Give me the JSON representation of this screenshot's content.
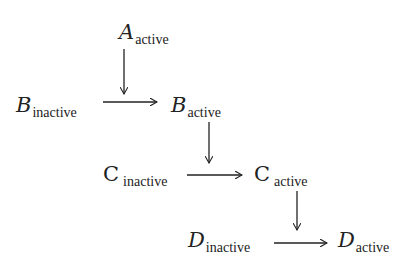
{
  "diagram": {
    "type": "state-transition",
    "nodes": [
      {
        "id": "A_active",
        "letter": "A",
        "state": "active",
        "x": 119,
        "y": 22
      },
      {
        "id": "B_inactive",
        "letter": "B",
        "state": "inactive",
        "x": 16,
        "y": 95
      },
      {
        "id": "B_active",
        "letter": "B",
        "state": "active",
        "x": 171,
        "y": 95
      },
      {
        "id": "C_inactive",
        "letter": "C",
        "state": "inactive",
        "x": 103,
        "y": 164
      },
      {
        "id": "C_active",
        "letter": "C",
        "state": "active",
        "x": 254,
        "y": 164
      },
      {
        "id": "D_inactive",
        "letter": "D",
        "state": "inactive",
        "x": 188,
        "y": 230
      },
      {
        "id": "D_active",
        "letter": "D",
        "state": "active",
        "x": 338,
        "y": 230
      }
    ],
    "edges": [
      {
        "from": "A_active",
        "to": "B_active",
        "direction": "down",
        "note": "activation input onto B transition"
      },
      {
        "from": "B_inactive",
        "to": "B_active",
        "direction": "right"
      },
      {
        "from": "B_active",
        "to": "C_active",
        "direction": "down",
        "note": "activation input onto C transition"
      },
      {
        "from": "C_inactive",
        "to": "C_active",
        "direction": "right"
      },
      {
        "from": "C_active",
        "to": "D_active",
        "direction": "down",
        "note": "activation input onto D transition"
      },
      {
        "from": "D_inactive",
        "to": "D_active",
        "direction": "right"
      }
    ],
    "labels": {
      "A_active": {
        "main": "A",
        "sub": "active"
      },
      "B_inactive": {
        "main": "B",
        "sub": "inactive"
      },
      "B_active": {
        "main": "B",
        "sub": "active"
      },
      "C_inactive": {
        "main": "C",
        "sub": "inactive"
      },
      "C_active": {
        "main": "C",
        "sub": "active"
      },
      "D_inactive": {
        "main": "D",
        "sub": "inactive"
      },
      "D_active": {
        "main": "D",
        "sub": "active"
      }
    }
  }
}
